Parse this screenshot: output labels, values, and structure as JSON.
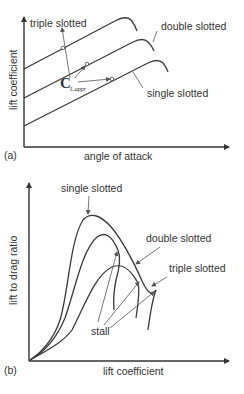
{
  "panel_a": {
    "tag": "(a)",
    "xlabel": "angle of attack",
    "ylabel": "lift coefficient",
    "labels": {
      "triple": "triple slotted",
      "double": "double slotted",
      "single": "single slotted"
    },
    "annotation_main": "C",
    "annotation_sub": "L,appr"
  },
  "panel_b": {
    "tag": "(b)",
    "xlabel": "lift coefficient",
    "ylabel": "lift to drag ratio",
    "labels": {
      "single": "single slotted",
      "double": "double slotted",
      "triple": "triple slotted",
      "stall": "stall"
    }
  },
  "colors": {
    "line": "#3a3a3a",
    "text": "#333333",
    "background": "#ffffff"
  }
}
